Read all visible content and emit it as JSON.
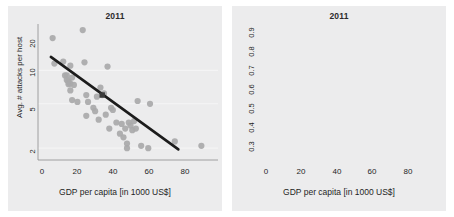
{
  "figure": {
    "background": "#ffffff",
    "panel_background": "#ececed",
    "point_color": "#a9a9aa",
    "trend_color": "#1c1c1c",
    "highlight_color": "#3b3b3b",
    "grid_color": "#f7f7f7"
  },
  "panels": [
    {
      "id": "left",
      "title": "2011",
      "ylabel": "Avg. # attacks per host",
      "xlabel": "GDP per capita [in 1000 US$]",
      "yticks": [
        "20",
        "10",
        "5",
        "2"
      ],
      "xticks": [
        "0",
        "20",
        "40",
        "60",
        "80"
      ]
    },
    {
      "id": "right",
      "title": "2011",
      "ylabel": "% attacked hosts",
      "xlabel": "GDP per capita [in 1000 US$]",
      "yticks": [
        "0.9",
        "0.8",
        "0.7",
        "0.6",
        "0.5",
        "0.4",
        "0.3"
      ],
      "xticks": [
        "0",
        "20",
        "40",
        "60",
        "80"
      ]
    }
  ],
  "chart_data": [
    {
      "type": "scatter",
      "panel": "left",
      "title": "2011",
      "xlabel": "GDP per capita [in 1000 US$]",
      "ylabel": "Avg. # attacks per host",
      "yscale": "log",
      "xlim": [
        -4,
        92
      ],
      "ylim": [
        1.7,
        24
      ],
      "xticks": [
        0,
        20,
        40,
        60,
        80
      ],
      "yticks": [
        20,
        10,
        5,
        2
      ],
      "grid": true,
      "gridlines_y": [
        10,
        5,
        2
      ],
      "legend": null,
      "x": [
        2,
        3,
        8,
        9,
        10,
        10,
        11,
        11,
        11,
        12,
        12,
        12,
        13,
        13,
        14,
        16,
        19,
        20,
        21,
        21,
        22,
        25,
        26,
        27,
        28,
        29,
        30,
        31,
        32,
        33,
        34,
        35,
        36,
        38,
        40,
        41,
        42,
        43,
        44,
        44,
        45,
        46,
        47,
        48,
        49,
        50,
        52,
        56,
        57,
        71,
        86
      ],
      "y": [
        19.5,
        11.5,
        12.0,
        9.0,
        9.0,
        8.2,
        8.0,
        7.8,
        7.5,
        11.0,
        7.6,
        6.6,
        8.6,
        5.4,
        7.4,
        5.2,
        23.0,
        11.8,
        6.0,
        3.9,
        5.2,
        4.6,
        4.3,
        5.8,
        3.6,
        7.0,
        6.0,
        6.2,
        4.0,
        10.8,
        3.0,
        4.6,
        4.4,
        3.4,
        2.7,
        3.3,
        2.5,
        3.0,
        2.2,
        2.0,
        3.4,
        3.2,
        2.9,
        3.5,
        3.0,
        5.3,
        2.1,
        2.0,
        5.0,
        2.3,
        2.1
      ],
      "highlight_point": {
        "x": 30,
        "y": 6.0,
        "marker": "square"
      },
      "trend": {
        "type": "linear-on-log",
        "x_start": 1,
        "y_start": 13.2,
        "x_end": 73,
        "y_end": 1.95
      }
    },
    {
      "type": "scatter",
      "panel": "right",
      "title": "2011",
      "xlabel": "GDP per capita [in 1000 US$]",
      "ylabel": "% attacked hosts",
      "yscale": "linear",
      "xlim": [
        -4,
        92
      ],
      "ylim": [
        0.28,
        0.93
      ],
      "xticks": [
        0,
        20,
        40,
        60,
        80
      ],
      "yticks": [
        0.9,
        0.8,
        0.7,
        0.6,
        0.5,
        0.4,
        0.3
      ],
      "grid": true,
      "gridlines_y": [
        0.9,
        0.8,
        0.7,
        0.6,
        0.5,
        0.4,
        0.3
      ],
      "legend": null,
      "x": [
        1,
        3,
        4,
        5,
        6,
        7,
        8,
        9,
        9,
        10,
        10,
        11,
        11,
        12,
        12,
        13,
        14,
        15,
        16,
        18,
        19,
        20,
        21,
        22,
        24,
        26,
        27,
        29,
        30,
        31,
        32,
        33,
        34,
        36,
        38,
        40,
        41,
        43,
        44,
        44,
        45,
        46,
        47,
        48,
        49,
        50,
        51,
        52,
        56,
        71,
        86
      ],
      "y": [
        0.8,
        0.79,
        0.8,
        0.81,
        0.75,
        0.72,
        0.71,
        0.7,
        0.68,
        0.695,
        0.67,
        0.7,
        0.66,
        0.73,
        0.6,
        0.685,
        0.59,
        0.76,
        0.72,
        0.6,
        0.51,
        0.7,
        0.9,
        0.545,
        0.525,
        0.44,
        0.555,
        0.52,
        0.64,
        0.4,
        0.5,
        0.72,
        0.49,
        0.595,
        0.43,
        0.5,
        0.48,
        0.345,
        0.32,
        0.325,
        0.47,
        0.485,
        0.5,
        0.485,
        0.375,
        0.49,
        0.48,
        0.37,
        0.355,
        0.385,
        0.36
      ],
      "highlight_point": {
        "x": 30,
        "y": 0.64,
        "marker": "square"
      },
      "trend": {
        "type": "exponential-decay",
        "points": [
          [
            1,
            0.795
          ],
          [
            10,
            0.715
          ],
          [
            20,
            0.645
          ],
          [
            30,
            0.585
          ],
          [
            40,
            0.525
          ],
          [
            50,
            0.472
          ],
          [
            60,
            0.42
          ],
          [
            70,
            0.375
          ],
          [
            80,
            0.335
          ],
          [
            87,
            0.305
          ]
        ]
      }
    }
  ]
}
